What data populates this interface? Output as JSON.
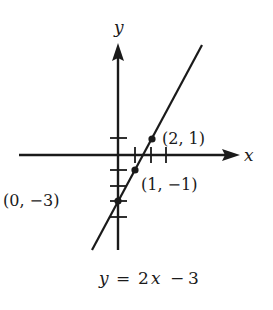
{
  "diagram": {
    "type": "coordinate-graph",
    "axes": {
      "x_label": "x",
      "y_label": "y"
    },
    "line": {
      "equation": "y = 2x − 3",
      "slope": 2,
      "intercept": -3
    },
    "points": [
      {
        "label": "(2, 1)",
        "x": 2,
        "y": 1
      },
      {
        "label": "(1, −1)",
        "x": 1,
        "y": -1
      },
      {
        "label": "(0, −3)",
        "x": 0,
        "y": -3
      }
    ],
    "caption": {
      "y": "y",
      "eq": "=",
      "coef": "2",
      "x": "x",
      "minus": "−",
      "const": "3"
    },
    "colors": {
      "ink": "#1a1a1a",
      "background": "#ffffff"
    }
  }
}
